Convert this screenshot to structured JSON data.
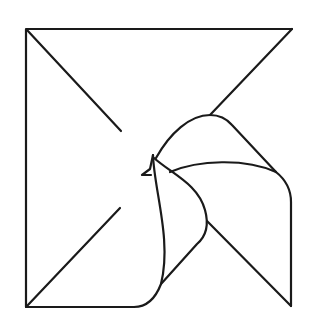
{
  "figure": {
    "description": "Line drawing of a square divided by diagonals with the lower-right quadrant curled up into a bird-like fold",
    "colors": {
      "background": "#ffffff",
      "stroke": "#1a1a1a"
    },
    "stroke_width": 2.2,
    "square": {
      "x1": 26,
      "y1": 29,
      "x2": 292,
      "y2": 307
    },
    "diagonals": {
      "upper_left": {
        "x1": 27,
        "y1": 30,
        "x2": 121,
        "y2": 131
      },
      "lower_left": {
        "x1": 27,
        "y1": 306,
        "x2": 120,
        "y2": 208
      },
      "upper_right": {
        "x1": 292,
        "y1": 29,
        "x2": 210,
        "y2": 115
      },
      "lower_right": {
        "x1": 207,
        "y1": 221,
        "x2": 291,
        "y2": 306
      }
    },
    "curl": {
      "outer_top": "M 156 160 C 170 135, 190 115, 210 115 C 218 115, 226 118, 232 126 L 276 172",
      "inner_fold": "M 170 172 C 195 160, 240 158, 276 172",
      "right_edge": "M 276 172 C 286 180, 291 190, 291 202 L 291 306",
      "beak_body_left": "M 152 156 C 155 190, 170 245, 160 285",
      "beak_body_right": "M 154 158 C 175 175, 200 185, 206 215 C 210 235, 200 240, 197 243 L 160 285",
      "bottom_edge": "M 26 307 L 130 307 C 145 307, 155 297, 160 285",
      "beak": "M 152 156 L 151 168 L 143 175 L 150 176"
    }
  }
}
